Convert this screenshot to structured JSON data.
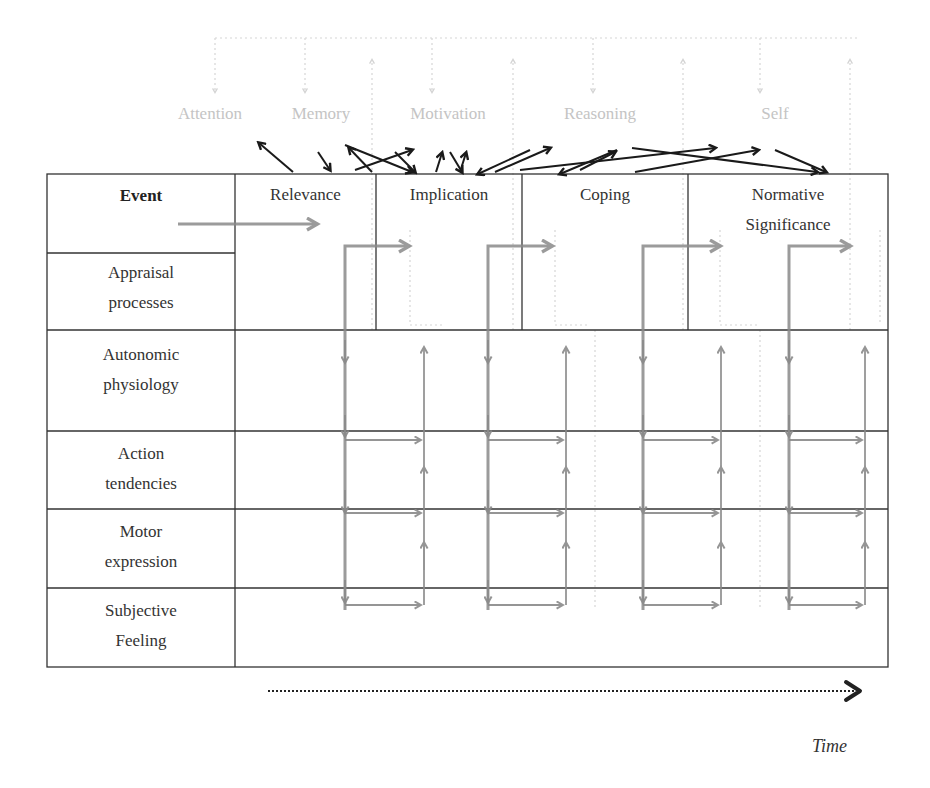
{
  "cognitive_functions": [
    "Attention",
    "Memory",
    "Motivation",
    "Reasoning",
    "Self"
  ],
  "row_labels": {
    "event": "Event",
    "appraisal": [
      "Appraisal",
      "processes"
    ],
    "autonomic": [
      "Autonomic",
      "physiology"
    ],
    "action": [
      "Action",
      "tendencies"
    ],
    "motor": [
      "Motor",
      "expression"
    ],
    "subjective": [
      "Subjective",
      "Feeling"
    ]
  },
  "appraisal_stages": [
    "Relevance",
    "Implication",
    "Coping",
    "Normative",
    "Significance"
  ],
  "time_axis_label": "Time",
  "colors": {
    "grid": "#333333",
    "gray_arrow": "#8a8a8a",
    "black_arrow": "#1a1a1a",
    "faint": "#d0d0d0"
  }
}
